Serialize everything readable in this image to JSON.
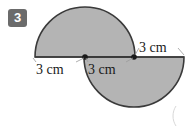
{
  "problem": {
    "number": "3"
  },
  "figure": {
    "name": "two-semicircles-figure",
    "fill_color": "#b4b4b4",
    "stroke_color": "#3a3a3a",
    "badge_color": "#6b6b6b",
    "background_color": "#ffffff",
    "upper_semicircle": {
      "center_x": 85,
      "center_y": 57,
      "radius": 50,
      "opening": "down"
    },
    "lower_semicircle": {
      "center_x": 134,
      "center_y": 57,
      "radius": 50,
      "opening": "up"
    },
    "vertex_dots": [
      {
        "x": 85,
        "y": 57
      },
      {
        "x": 134,
        "y": 57
      }
    ]
  },
  "labels": {
    "left": "3 cm",
    "middle": "3 cm",
    "right": "3 cm"
  }
}
